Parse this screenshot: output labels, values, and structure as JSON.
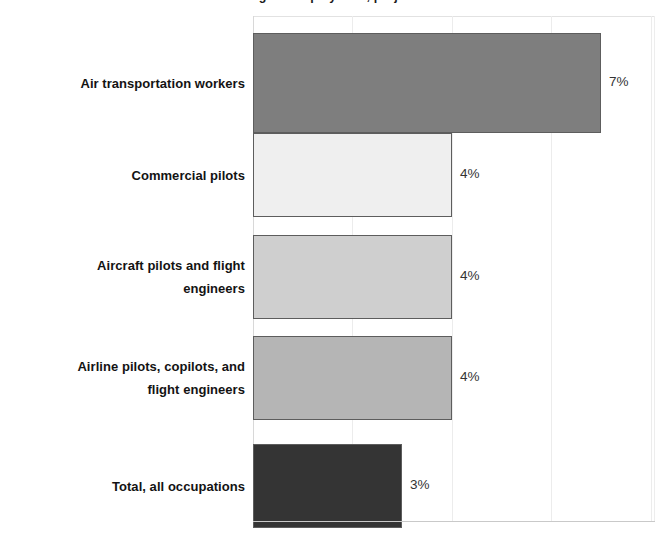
{
  "chart_data": {
    "type": "bar",
    "orientation": "horizontal",
    "title": "Percent change in employment, projected 2022-32",
    "xlabel": "",
    "ylabel": "",
    "xlim": [
      0,
      8
    ],
    "grid": true,
    "grid_axis": "x",
    "legend": "none",
    "value_suffix": "%",
    "categories": [
      "Air transportation workers",
      "Commercial pilots",
      "Aircraft pilots and flight engineers",
      "Airline pilots, copilots, and flight engineers",
      "Total, all occupations"
    ],
    "values": [
      7,
      4,
      4,
      4,
      3
    ],
    "value_labels": [
      "7%",
      "4%",
      "4%",
      "4%",
      "3%"
    ],
    "bar_colors": [
      "#7e7e7e",
      "#efefef",
      "#cfcfcf",
      "#b5b5b5",
      "#343434"
    ],
    "bar_border_color": "#5d5d5d"
  },
  "bars": [
    {
      "label_lines": [
        "Air transportation workers"
      ],
      "value": 7,
      "value_label": "7%",
      "color": "#7e7e7e"
    },
    {
      "label_lines": [
        "Commercial pilots"
      ],
      "value": 4,
      "value_label": "4%",
      "color": "#efefef"
    },
    {
      "label_lines": [
        "Aircraft pilots and flight",
        "engineers"
      ],
      "value": 4,
      "value_label": "4%",
      "color": "#cfcfcf"
    },
    {
      "label_lines": [
        "Airline pilots, copilots, and",
        "flight engineers"
      ],
      "value": 4,
      "value_label": "4%",
      "color": "#b5b5b5"
    },
    {
      "label_lines": [
        "Total, all occupations"
      ],
      "value": 3,
      "value_label": "3%",
      "color": "#343434"
    }
  ],
  "axis": {
    "gridline_values": [
      2,
      4,
      6,
      8
    ],
    "px_per_unit": 49.7,
    "plot_left_px": 253,
    "plot_width_px": 402
  }
}
